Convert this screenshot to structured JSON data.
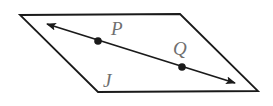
{
  "diagram": {
    "type": "geometry",
    "plane": {
      "label": "J",
      "shape": "parallelogram",
      "corners": [
        [
          20,
          15
        ],
        [
          180,
          14
        ],
        [
          258,
          91
        ],
        [
          98,
          92
        ]
      ],
      "stroke": "#1a1a1a"
    },
    "line": {
      "from": [
        47,
        24
      ],
      "to": [
        235,
        83
      ],
      "arrows": "both",
      "stroke": "#1a1a1a"
    },
    "points": [
      {
        "label": "P",
        "x": 98,
        "y": 41,
        "label_x": 111,
        "label_y": 35
      },
      {
        "label": "Q",
        "x": 182,
        "y": 67,
        "label_x": 173,
        "label_y": 55
      }
    ],
    "plane_label": {
      "text": "J",
      "x": 103,
      "y": 87
    },
    "label_color": "#6f6f6f"
  }
}
